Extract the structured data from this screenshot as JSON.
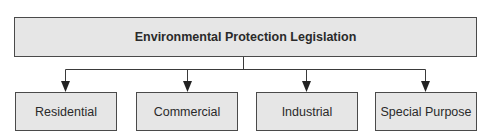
{
  "diagram": {
    "type": "hierarchy",
    "root": {
      "label": "Environmental Protection Legislation"
    },
    "children": [
      {
        "label": "Residential"
      },
      {
        "label": "Commercial"
      },
      {
        "label": "Industrial"
      },
      {
        "label": "Special Purpose"
      }
    ],
    "edges": [
      {
        "from": "Environmental Protection Legislation",
        "to": "Residential"
      },
      {
        "from": "Environmental Protection Legislation",
        "to": "Commercial"
      },
      {
        "from": "Environmental Protection Legislation",
        "to": "Industrial"
      },
      {
        "from": "Environmental Protection Legislation",
        "to": "Special Purpose"
      }
    ],
    "colors": {
      "box_fill": "#e6e6e6",
      "box_border": "#4a4a4a",
      "line": "#3a3a3a",
      "text": "#2a2a2a"
    }
  }
}
